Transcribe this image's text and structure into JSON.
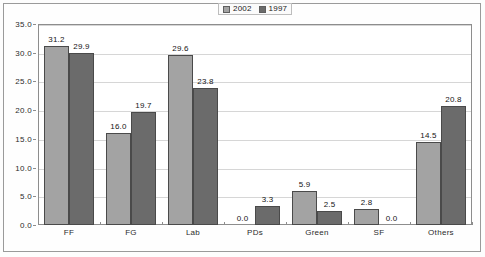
{
  "chart_data": {
    "type": "bar",
    "title": "",
    "xlabel": "",
    "ylabel": "",
    "ylim": [
      0,
      35
    ],
    "ytick_step": 5,
    "ytick_labels": [
      "0.0",
      "5.0",
      "10.0",
      "15.0",
      "20.0",
      "25.0",
      "30.0",
      "35.0"
    ],
    "grid": true,
    "legend_position": "top-center",
    "categories": [
      "FF",
      "FG",
      "Lab",
      "PDs",
      "Green",
      "SF",
      "Others"
    ],
    "series": [
      {
        "name": "2002",
        "color": "#a3a3a3",
        "values": [
          31.2,
          16.0,
          29.6,
          0.0,
          5.9,
          2.8,
          14.5
        ],
        "value_labels": [
          "31.2",
          "16.0",
          "29.6",
          "0.0",
          "5.9",
          "2.8",
          "14.5"
        ]
      },
      {
        "name": "1997",
        "color": "#6b6b6b",
        "values": [
          29.9,
          19.7,
          23.8,
          3.3,
          2.5,
          0.0,
          20.8
        ],
        "value_labels": [
          "29.9",
          "19.7",
          "23.8",
          "3.3",
          "2.5",
          "0.0",
          "20.8"
        ]
      }
    ]
  },
  "legend": {
    "items": [
      {
        "label": "2002",
        "swatch_color": "#a3a3a3"
      },
      {
        "label": "1997",
        "swatch_color": "#6b6b6b"
      }
    ]
  }
}
